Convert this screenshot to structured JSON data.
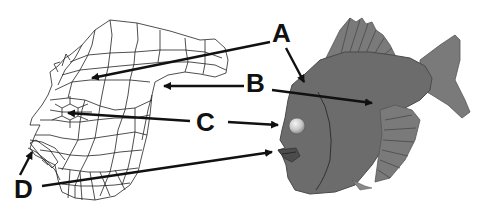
{
  "figure": {
    "left_panel": "wireframe-mesh",
    "right_panel": "rendered-fish",
    "colors": {
      "background": "#ffffff",
      "wire": "#222222",
      "fish": "#6c6c6c",
      "eye": "#d8d8d8",
      "labels": "#111111"
    }
  },
  "labels": [
    {
      "id": "A",
      "text": "A"
    },
    {
      "id": "B",
      "text": "B"
    },
    {
      "id": "C",
      "text": "C"
    },
    {
      "id": "D",
      "text": "D"
    }
  ]
}
